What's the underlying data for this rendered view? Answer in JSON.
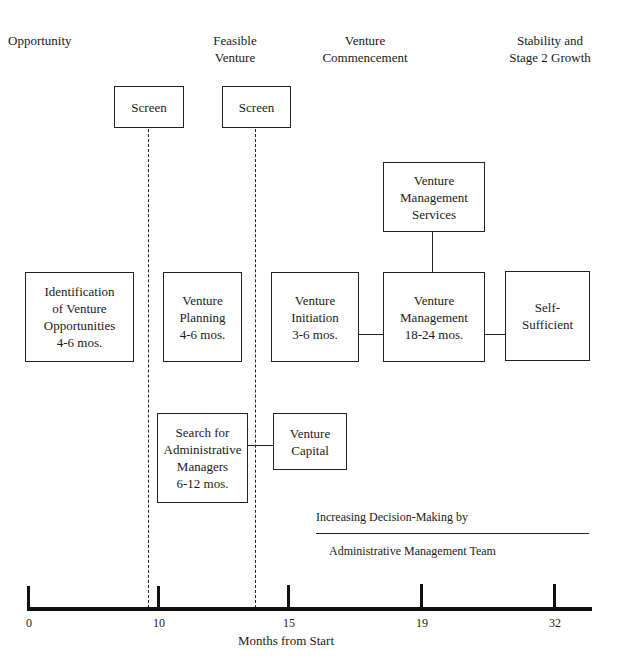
{
  "phases": [
    {
      "label": "Opportunity"
    },
    {
      "label": "Feasible\nVenture"
    },
    {
      "label": "Venture\nCommencement"
    },
    {
      "label": "Stability and\nStage 2 Growth"
    }
  ],
  "screens": [
    {
      "label": "Screen"
    },
    {
      "label": "Screen"
    }
  ],
  "boxes": {
    "identification": "Identification\nof Venture\nOpportunities\n4-6 mos.",
    "planning": "Venture\nPlanning\n4-6 mos.",
    "initiation": "Venture\nInitiation\n3-6 mos.",
    "management": "Venture\nManagement\n18-24 mos.",
    "services": "Venture\nManagement\nServices",
    "self_sufficient": "Self-\nSufficient",
    "search": "Search for\nAdministrative\nManagers\n6-12 mos.",
    "capital": "Venture\nCapital"
  },
  "notes": {
    "increasing": "Increasing Decision-Making by",
    "team": "Administrative Management Team"
  },
  "axis": {
    "ticks": [
      "0",
      "10",
      "15",
      "19",
      "32"
    ],
    "label": "Months from Start"
  }
}
